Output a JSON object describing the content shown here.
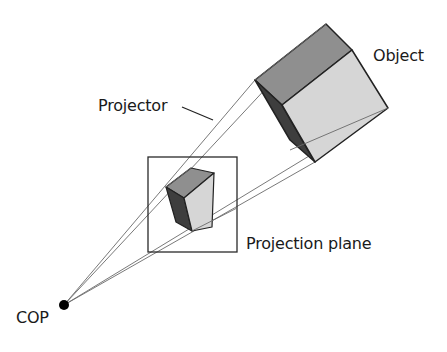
{
  "diagram": {
    "labels": {
      "object": "Object",
      "projector": "Projector",
      "projection_plane": "Projection plane",
      "cop": "COP"
    },
    "colors": {
      "background": "#ffffff",
      "line": "#2a2a2a",
      "projector_line": "#6a6a6a",
      "face_top": "#8f8f8f",
      "face_front": "#d6d6d6",
      "face_side": "#3e3e3e",
      "cop_point": "#000000"
    }
  }
}
